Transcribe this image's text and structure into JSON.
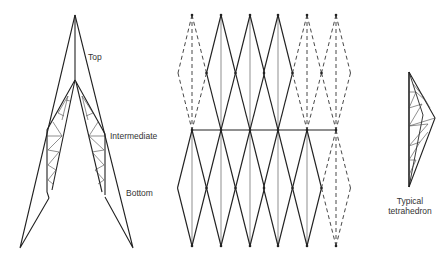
{
  "figure": {
    "left_truss": {
      "labels": {
        "top": "Top",
        "intermediate": "Intermediate",
        "bottom": "Bottom"
      }
    },
    "middle_grid": {
      "description": "Diamond lattice of tetrahedral modules; outer modules dashed"
    },
    "right_detail": {
      "label_line1": "Typical",
      "label_line2": "tetrahedron"
    }
  }
}
